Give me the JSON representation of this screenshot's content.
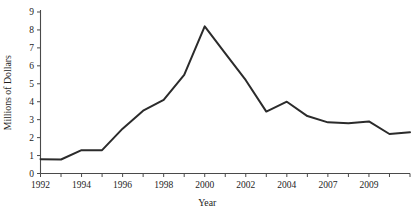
{
  "chart_data": {
    "type": "line",
    "title": "",
    "xlabel": "Year",
    "ylabel": "Millions of Dollars",
    "xlim": [
      1992,
      2010
    ],
    "ylim": [
      0,
      9
    ],
    "grid": false,
    "legend": null,
    "x_tick_labels": [
      "1992",
      "1994",
      "1996",
      "1998",
      "2000",
      "2002",
      "2004",
      "2007",
      "2009"
    ],
    "x_tick_values": [
      1992,
      1994,
      1996,
      1998,
      2000,
      2002,
      2004,
      2006,
      2008
    ],
    "y_tick_labels": [
      "0",
      "1",
      "2",
      "3",
      "4",
      "5",
      "6",
      "7",
      "8",
      "9"
    ],
    "y_tick_values": [
      0,
      1,
      2,
      3,
      4,
      5,
      6,
      7,
      8,
      9
    ],
    "minor_x_ticks": [
      1992,
      1993,
      1994,
      1995,
      1996,
      1997,
      1998,
      1999,
      2000,
      2001,
      2002,
      2003,
      2004,
      2005,
      2006,
      2007,
      2008,
      2009,
      2010
    ],
    "series": [
      {
        "name": "Millions of Dollars",
        "color": "#2b2b2b",
        "x": [
          1992,
          1993,
          1994,
          1995,
          1996,
          1997,
          1998,
          1999,
          2000,
          2001,
          2002,
          2003,
          2004,
          2005,
          2006,
          2007,
          2008,
          2009,
          2010
        ],
        "values": [
          0.8,
          0.78,
          1.3,
          1.3,
          2.5,
          3.5,
          4.1,
          5.5,
          8.2,
          6.7,
          5.2,
          3.45,
          4.0,
          3.2,
          2.85,
          2.8,
          2.9,
          2.2,
          2.3
        ]
      }
    ]
  },
  "axes": {
    "y_axis_title": "Millions of Dollars",
    "x_axis_title": "Year"
  }
}
